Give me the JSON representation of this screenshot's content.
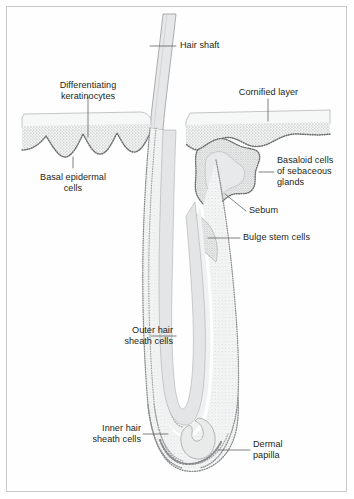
{
  "figure": {
    "type": "biological-cross-section",
    "frame_color": "#c9c9c9",
    "background_color": "#ffffff",
    "text_color": "#231f20",
    "leader_line_color": "#58595b",
    "fill_light": "#eceded",
    "fill_mid": "#e2e3e4",
    "stipple_color": "#9a9b9d",
    "outline_color": "#8d8e90"
  },
  "labels": {
    "hair_shaft": "Hair shaft",
    "differentiating_keratinocytes": "Differentiating\nkeratinocytes",
    "cornified_layer": "Cornified layer",
    "basal_epidermal_cells": "Basal epidermal\ncells",
    "basaloid_cells": "Basaloid cells\nof sebaceous\nglands",
    "sebum": "Sebum",
    "bulge_stem_cells": "Bulge stem cells",
    "outer_hair_sheath_cells": "Outer hair\nsheath cells",
    "inner_hair_sheath_cells": "Inner hair\nsheath cells",
    "dermal_papilla": "Dermal\npapilla"
  }
}
